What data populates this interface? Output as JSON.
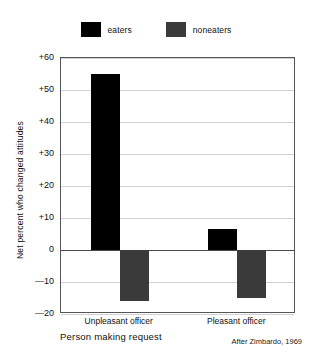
{
  "chart_data": {
    "type": "bar",
    "title": "",
    "subtitle": "",
    "xlabel": "Person making request",
    "ylabel": "Net percent who changed attitudes",
    "categories": [
      "Unpleasant officer",
      "Pleasant officer"
    ],
    "series": [
      {
        "name": "eaters",
        "color": "#000000",
        "values": [
          55,
          6.5
        ]
      },
      {
        "name": "noneaters",
        "color": "#3a3a3a",
        "values": [
          -16,
          -15
        ]
      }
    ],
    "ylim": [
      -20,
      60
    ],
    "ytick_values": [
      60,
      50,
      40,
      30,
      20,
      10,
      0,
      -10,
      -20
    ],
    "ytick_labels": [
      "+60",
      "+50",
      "+40",
      "+30",
      "+20",
      "+10",
      "0",
      "—10",
      "—20"
    ],
    "grid": true,
    "grid_axis": "y",
    "zero_line": true,
    "legend": {
      "position": "top-center",
      "entries": [
        "eaters",
        "noneaters"
      ]
    },
    "annotations": [
      "After Zimbardo, 1969"
    ]
  },
  "legend": {
    "items": [
      {
        "label": "eaters",
        "color": "#000000",
        "swatch_icon": "legend-swatch-eaters"
      },
      {
        "label": "noneaters",
        "color": "#3a3a3a",
        "swatch_icon": "legend-swatch-noneaters"
      }
    ]
  },
  "axes": {
    "y_title": "Net percent who changed attitudes",
    "x_title": "Person making request"
  },
  "source": {
    "note": "After Zimbardo, 1969"
  }
}
